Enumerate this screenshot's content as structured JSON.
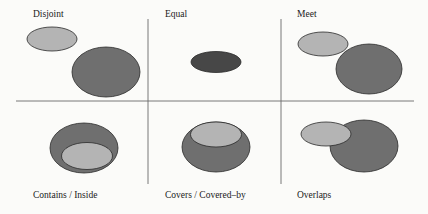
{
  "colors": {
    "light_region": "#b4b4b4",
    "medium_region": "#6f6f6f",
    "dark_region": "#474747",
    "stroke": "#2a2a2a",
    "grid": "#6a6a6a",
    "background": "#fbfbf9"
  },
  "panels": [
    {
      "id": "disjoint",
      "label": "Disjoint"
    },
    {
      "id": "equal",
      "label": "Equal"
    },
    {
      "id": "meet",
      "label": "Meet"
    },
    {
      "id": "contains",
      "label": "Contains / Inside"
    },
    {
      "id": "covers",
      "label": "Covers / Covered–by"
    },
    {
      "id": "overlaps",
      "label": "Overlaps"
    }
  ]
}
